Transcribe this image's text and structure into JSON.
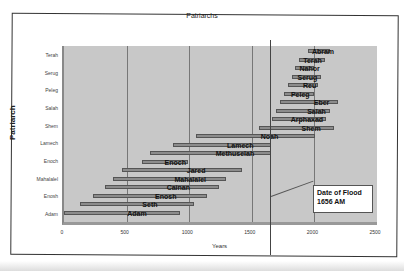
{
  "chart_data": {
    "type": "bar",
    "orientation": "horizontal-gantt",
    "title": "Patriarchs",
    "xlabel": "Years",
    "ylabel": "Patriarch",
    "xlim": [
      0,
      2500
    ],
    "xticks": [
      0,
      500,
      1000,
      1500,
      2000,
      2500
    ],
    "yticks": [
      "Adam",
      "Enosh",
      "Mahalalel",
      "Enoch",
      "Lamech",
      "Shem",
      "Salah",
      "Peleg",
      "Serug",
      "Terah"
    ],
    "grid": true,
    "series": [
      {
        "name": "Adam",
        "start": 0,
        "end": 930
      },
      {
        "name": "Seth",
        "start": 130,
        "end": 1042
      },
      {
        "name": "Enosh",
        "start": 235,
        "end": 1140
      },
      {
        "name": "Cainan",
        "start": 325,
        "end": 1235
      },
      {
        "name": "Mahalalel",
        "start": 395,
        "end": 1290
      },
      {
        "name": "Jared",
        "start": 460,
        "end": 1422
      },
      {
        "name": "Enoch",
        "start": 622,
        "end": 987
      },
      {
        "name": "Methuselah",
        "start": 687,
        "end": 1656
      },
      {
        "name": "Lamech",
        "start": 874,
        "end": 1651
      },
      {
        "name": "Noah",
        "start": 1056,
        "end": 2006
      },
      {
        "name": "Shem",
        "start": 1558,
        "end": 2158
      },
      {
        "name": "Arphaxad",
        "start": 1658,
        "end": 2096
      },
      {
        "name": "Salah",
        "start": 1693,
        "end": 2126
      },
      {
        "name": "Eber",
        "start": 1723,
        "end": 2187
      },
      {
        "name": "Peleg",
        "start": 1757,
        "end": 1996
      },
      {
        "name": "Reu",
        "start": 1787,
        "end": 2026
      },
      {
        "name": "Serug",
        "start": 1819,
        "end": 2049
      },
      {
        "name": "Nahor",
        "start": 1849,
        "end": 1997
      },
      {
        "name": "Terah",
        "start": 1878,
        "end": 2083
      },
      {
        "name": "Abram",
        "start": 1948,
        "end": 2123
      }
    ],
    "annotations": [
      {
        "text": "Date of Flood\n1656 AM",
        "x": 1656,
        "type": "vertical-line"
      }
    ],
    "legend": "none"
  },
  "annotation": {
    "line1": "Date of Flood",
    "line2": "1656 AM"
  }
}
